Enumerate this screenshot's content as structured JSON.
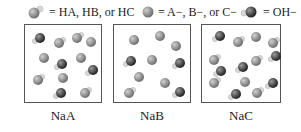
{
  "legend": [
    {
      "icon": "HA-molecule-icon",
      "label": "= HA, HB, or HC"
    },
    {
      "icon": "anion-icon",
      "label": "= A−, B−, or C−"
    },
    {
      "icon": "hydroxide-icon",
      "label": "= OH−"
    }
  ],
  "colors": {
    "anion": "#8a8a8a",
    "acid": "#8a8a8a",
    "hydroxide": "#3a3a3a",
    "hydrogen": "#d8d8d8",
    "border": "#555555"
  },
  "boxes": [
    {
      "label": "NaA",
      "molecules": [
        {
          "type": "OH",
          "x": 9,
          "y": 8
        },
        {
          "type": "HA",
          "x": 28,
          "y": 13
        },
        {
          "type": "HA",
          "x": 46,
          "y": 8
        },
        {
          "type": "A",
          "x": 60,
          "y": 12
        },
        {
          "type": "A",
          "x": 13,
          "y": 28
        },
        {
          "type": "OH",
          "x": 31,
          "y": 34
        },
        {
          "type": "A",
          "x": 50,
          "y": 28
        },
        {
          "type": "OH",
          "x": 62,
          "y": 40
        },
        {
          "type": "HA",
          "x": 7,
          "y": 50
        },
        {
          "type": "A",
          "x": 32,
          "y": 48
        },
        {
          "type": "OH",
          "x": 30,
          "y": 63
        },
        {
          "type": "HA",
          "x": 54,
          "y": 63
        }
      ]
    },
    {
      "label": "NaB",
      "molecules": [
        {
          "type": "A",
          "x": 14,
          "y": 10
        },
        {
          "type": "A",
          "x": 40,
          "y": 6
        },
        {
          "type": "A",
          "x": 56,
          "y": 16
        },
        {
          "type": "OH",
          "x": 11,
          "y": 31
        },
        {
          "type": "A",
          "x": 32,
          "y": 30
        },
        {
          "type": "OH",
          "x": 60,
          "y": 33
        },
        {
          "type": "A",
          "x": 19,
          "y": 47
        },
        {
          "type": "A",
          "x": 45,
          "y": 53
        },
        {
          "type": "HA",
          "x": 9,
          "y": 63
        },
        {
          "type": "OH",
          "x": 60,
          "y": 62
        }
      ]
    },
    {
      "label": "NaC",
      "molecules": [
        {
          "type": "OH",
          "x": 12,
          "y": 6
        },
        {
          "type": "HA",
          "x": 30,
          "y": 12
        },
        {
          "type": "A",
          "x": 48,
          "y": 7
        },
        {
          "type": "HA",
          "x": 65,
          "y": 13
        },
        {
          "type": "HA",
          "x": 6,
          "y": 30
        },
        {
          "type": "OH",
          "x": 68,
          "y": 26
        },
        {
          "type": "OH",
          "x": 13,
          "y": 41
        },
        {
          "type": "OH",
          "x": 35,
          "y": 37
        },
        {
          "type": "HA",
          "x": 48,
          "y": 31
        },
        {
          "type": "HA",
          "x": 6,
          "y": 53
        },
        {
          "type": "A",
          "x": 37,
          "y": 52
        },
        {
          "type": "OH",
          "x": 65,
          "y": 53
        },
        {
          "type": "OH",
          "x": 28,
          "y": 64
        },
        {
          "type": "HA",
          "x": 49,
          "y": 63
        }
      ]
    }
  ]
}
